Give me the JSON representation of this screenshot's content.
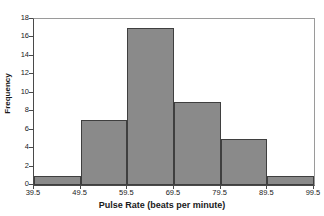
{
  "chart_data": {
    "type": "bar",
    "title": "",
    "subtitle": "",
    "xlabel": "Pulse Rate (beats per minute)",
    "ylabel": "Frequency",
    "categories": [
      "39.5-49.5",
      "49.5-59.5",
      "59.5-69.5",
      "69.5-79.5",
      "79.5-89.5",
      "89.5-99.5"
    ],
    "values": [
      1,
      7,
      17,
      9,
      5,
      1
    ],
    "bin_edges": [
      39.5,
      49.5,
      59.5,
      69.5,
      79.5,
      89.5,
      99.5
    ],
    "bin_width": 10,
    "xlim": [
      39.5,
      99.5
    ],
    "ylim": [
      0,
      18
    ],
    "x_ticks": [
      "39.5",
      "49.5",
      "59.5",
      "69.5",
      "79.5",
      "89.5",
      "99.5"
    ],
    "x_tick_values": [
      39.5,
      49.5,
      59.5,
      69.5,
      79.5,
      89.5,
      99.5
    ],
    "y_ticks": [
      "0",
      "2",
      "4",
      "6",
      "8",
      "10",
      "12",
      "14",
      "16",
      "18"
    ],
    "y_tick_values": [
      0,
      2,
      4,
      6,
      8,
      10,
      12,
      14,
      16,
      18
    ],
    "grid": false,
    "legend": false,
    "legend_position": "none",
    "bar_fill_color": "#8a8a8a",
    "bar_edge_color": "#3f3f3f",
    "axis_color": "#4a4a4a",
    "plot_background_color": "#ffffff",
    "total_count": 40
  }
}
